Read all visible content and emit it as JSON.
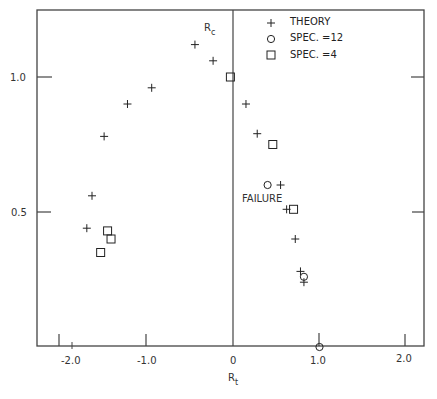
{
  "chart_data": {
    "type": "scatter",
    "title": "",
    "xlabel": "R_t",
    "ylabel": "R_c",
    "xlim": [
      -2.4,
      2.2
    ],
    "ylim": [
      0,
      1.25
    ],
    "grid": false,
    "legend_position": "top-right (inside)",
    "x_ticks": [
      "-2.0",
      "-1.0",
      "0",
      "1.0",
      "2.0"
    ],
    "y_ticks": [
      "0.5",
      "1.0"
    ],
    "series": [
      {
        "name": "THEORY",
        "marker": "+",
        "points": [
          {
            "x": -0.44,
            "y": 1.12
          },
          {
            "x": -0.23,
            "y": 1.06
          },
          {
            "x": -0.94,
            "y": 0.96
          },
          {
            "x": -1.22,
            "y": 0.9
          },
          {
            "x": -1.49,
            "y": 0.78
          },
          {
            "x": -1.63,
            "y": 0.56
          },
          {
            "x": -1.69,
            "y": 0.44
          },
          {
            "x": 0.15,
            "y": 0.9
          },
          {
            "x": 0.28,
            "y": 0.79
          },
          {
            "x": 0.55,
            "y": 0.6
          },
          {
            "x": 0.62,
            "y": 0.51
          },
          {
            "x": 0.72,
            "y": 0.4
          },
          {
            "x": 0.78,
            "y": 0.28
          },
          {
            "x": 0.82,
            "y": 0.24
          }
        ]
      },
      {
        "name": "SPEC. =12",
        "marker": "circle",
        "points": [
          {
            "x": 0.4,
            "y": 0.6
          },
          {
            "x": 0.82,
            "y": 0.26
          },
          {
            "x": 1.0,
            "y": 0.0
          }
        ]
      },
      {
        "name": "SPEC. =4",
        "marker": "square",
        "points": [
          {
            "x": -0.03,
            "y": 1.0
          },
          {
            "x": 0.46,
            "y": 0.75
          },
          {
            "x": 0.7,
            "y": 0.51
          },
          {
            "x": -1.45,
            "y": 0.43
          },
          {
            "x": -1.41,
            "y": 0.4
          },
          {
            "x": -1.53,
            "y": 0.35
          }
        ]
      }
    ],
    "annotations": [
      {
        "text": "FAILURE",
        "x": 0.33,
        "y": 0.55
      },
      {
        "text": "R_c",
        "x": -0.3,
        "y": 1.19
      }
    ]
  },
  "labels": {
    "xlabel_main": "R",
    "xlabel_sub": "t",
    "ylabel_main": "R",
    "ylabel_sub": "c",
    "failure": "FAILURE",
    "legend": [
      "THEORY",
      "SPEC. =12",
      "SPEC. =4"
    ],
    "xticks": [
      "-2.0",
      "-1.0",
      "0",
      "1.0",
      "2.0"
    ],
    "yticks": [
      "0.5",
      "1.0"
    ]
  }
}
